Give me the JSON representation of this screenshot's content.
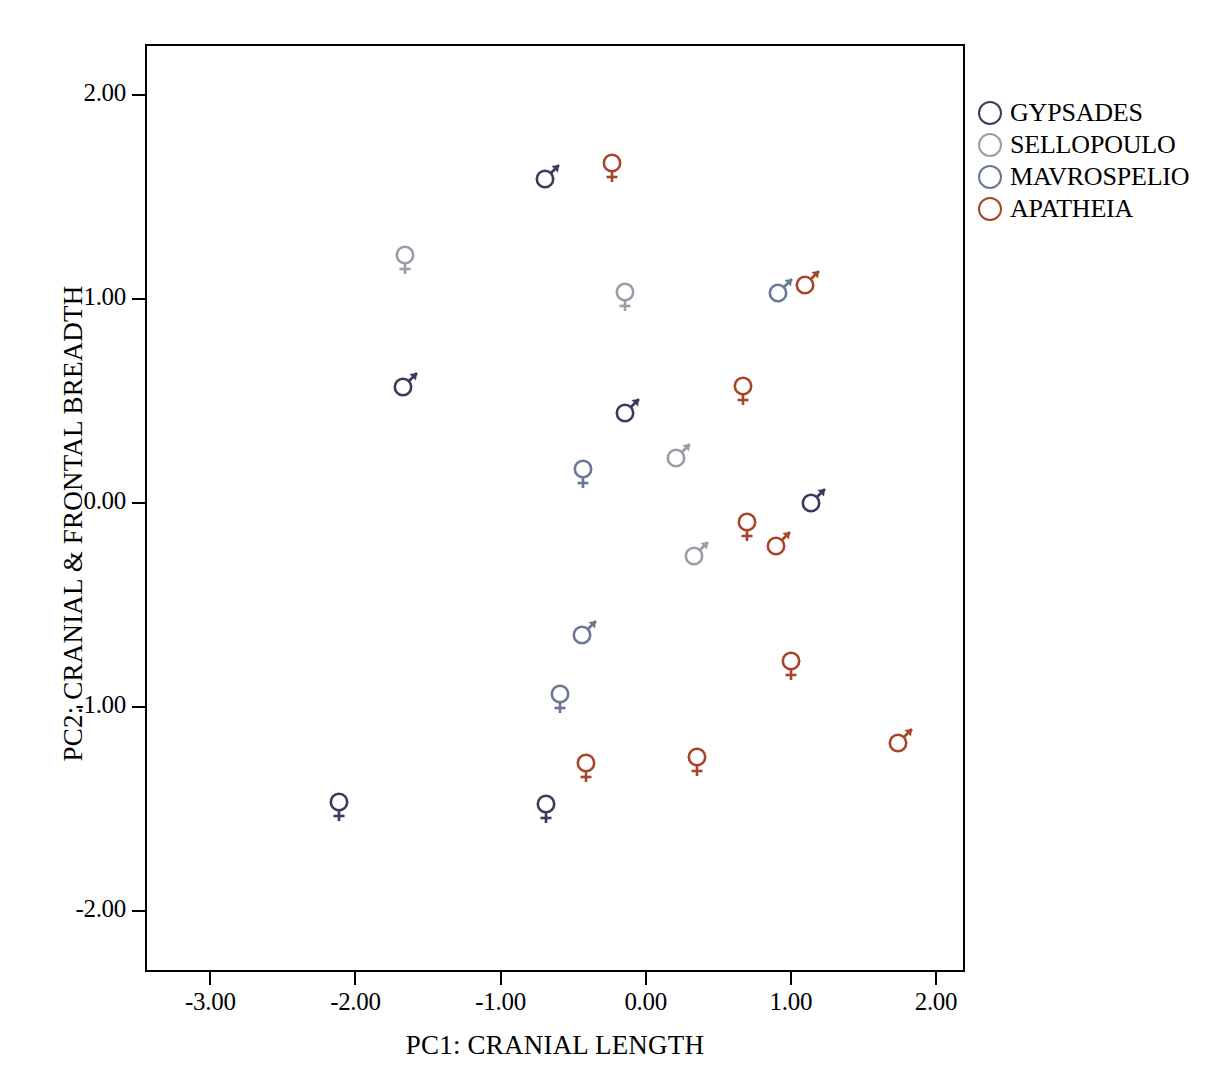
{
  "chart_data": {
    "type": "scatter",
    "title": "",
    "xlabel": "PC1: CRANIAL LENGTH",
    "ylabel": "PC2: CRANIAL & FRONTAL BREADTH",
    "xlim": [
      -3.45,
      2.2
    ],
    "ylim": [
      -2.3,
      2.25
    ],
    "xticks": [
      "-3.00",
      "-2.00",
      "-1.00",
      "0.00",
      "1.00",
      "2.00"
    ],
    "xtick_values": [
      -3,
      -2,
      -1,
      0,
      1,
      2
    ],
    "yticks": [
      "2.00",
      "1.00",
      "0.00",
      "-1.00",
      "-2.00"
    ],
    "ytick_values": [
      2,
      1,
      0,
      -1,
      -2
    ],
    "grid": false,
    "legend_position": "right",
    "marker_style": "gender-symbols",
    "series": [
      {
        "name": "GYPSADES",
        "color": "#3a3a5c",
        "points": [
          {
            "x": -0.67,
            "y": 1.61,
            "sex": "male"
          },
          {
            "x": -1.65,
            "y": 0.59,
            "sex": "male"
          },
          {
            "x": -0.12,
            "y": 0.46,
            "sex": "male"
          },
          {
            "x": 1.16,
            "y": 0.02,
            "sex": "male"
          },
          {
            "x": -2.11,
            "y": -1.49,
            "sex": "female"
          },
          {
            "x": -0.69,
            "y": -1.5,
            "sex": "female"
          }
        ]
      },
      {
        "name": "SELLOPOULO",
        "color": "#9b9bab",
        "points": [
          {
            "x": -1.66,
            "y": 1.19,
            "sex": "female"
          },
          {
            "x": -0.14,
            "y": 1.01,
            "sex": "female"
          },
          {
            "x": 0.23,
            "y": 0.24,
            "sex": "male"
          },
          {
            "x": 0.35,
            "y": -0.24,
            "sex": "male"
          }
        ]
      },
      {
        "name": "MAVROSPELIO",
        "color": "#6a7796",
        "points": [
          {
            "x": 0.93,
            "y": 1.05,
            "sex": "male"
          },
          {
            "x": -0.43,
            "y": 0.14,
            "sex": "female"
          },
          {
            "x": -0.42,
            "y": -0.63,
            "sex": "male"
          },
          {
            "x": -0.59,
            "y": -0.96,
            "sex": "female"
          }
        ]
      },
      {
        "name": "APATHEIA",
        "color": "#a6452a",
        "points": [
          {
            "x": -0.23,
            "y": 1.64,
            "sex": "female"
          },
          {
            "x": 1.12,
            "y": 1.09,
            "sex": "male"
          },
          {
            "x": 0.67,
            "y": 0.55,
            "sex": "female"
          },
          {
            "x": 0.7,
            "y": -0.12,
            "sex": "female"
          },
          {
            "x": 0.92,
            "y": -0.19,
            "sex": "male"
          },
          {
            "x": 1.0,
            "y": -0.8,
            "sex": "female"
          },
          {
            "x": 0.35,
            "y": -1.27,
            "sex": "female"
          },
          {
            "x": -0.41,
            "y": -1.3,
            "sex": "female"
          },
          {
            "x": 1.76,
            "y": -1.16,
            "sex": "male"
          }
        ]
      }
    ]
  },
  "legend": {
    "items": [
      {
        "label": "GYPSADES",
        "color": "#3a3a5c"
      },
      {
        "label": "SELLOPOULO",
        "color": "#9b9bab"
      },
      {
        "label": "MAVROSPELIO",
        "color": "#6a7796"
      },
      {
        "label": "APATHEIA",
        "color": "#a6452a"
      }
    ]
  }
}
